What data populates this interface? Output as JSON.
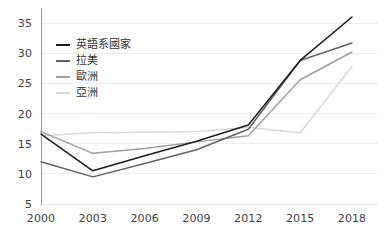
{
  "chart_data": {
    "type": "line",
    "title": "",
    "xlabel": "",
    "ylabel": "",
    "categories": [
      "2000",
      "2003",
      "2006",
      "2009",
      "2012",
      "2015",
      "2018"
    ],
    "x": [
      2000,
      2003,
      2006,
      2009,
      2012,
      2015,
      2018
    ],
    "xlim": [
      2000,
      2018
    ],
    "ylim": [
      5,
      36.5
    ],
    "yticks": [
      5,
      10,
      15,
      20,
      25,
      30,
      35
    ],
    "ytick_labels": [
      "5",
      "10",
      "15",
      "20",
      "25",
      "30",
      "35"
    ],
    "grid": "horizontal",
    "legend_position": "upper-left-inside",
    "series": [
      {
        "name": "英語系國家",
        "color": "#1d1d1d",
        "values": [
          16.6,
          10.5,
          13.0,
          15.4,
          18.1,
          28.8,
          36.0
        ]
      },
      {
        "name": "拉美",
        "color": "#636363",
        "values": [
          12.0,
          9.5,
          11.7,
          14.0,
          17.4,
          28.8,
          31.7
        ]
      },
      {
        "name": "歐洲",
        "color": "#a0a0a0",
        "values": [
          17.0,
          13.4,
          14.2,
          15.3,
          16.3,
          25.6,
          30.2
        ]
      },
      {
        "name": "亞洲",
        "color": "#d8d8d8",
        "values": [
          16.3,
          16.8,
          16.9,
          17.0,
          17.7,
          16.8,
          27.8
        ]
      }
    ]
  },
  "axis": {
    "y_axis_color": "#9a9a9a",
    "grid_color": "#ededed"
  },
  "legend": {
    "items": [
      {
        "label": "英語系國家",
        "color": "#1d1d1d"
      },
      {
        "label": "拉美",
        "color": "#636363"
      },
      {
        "label": "歐洲",
        "color": "#a0a0a0"
      },
      {
        "label": "亞洲",
        "color": "#d8d8d8"
      }
    ]
  }
}
